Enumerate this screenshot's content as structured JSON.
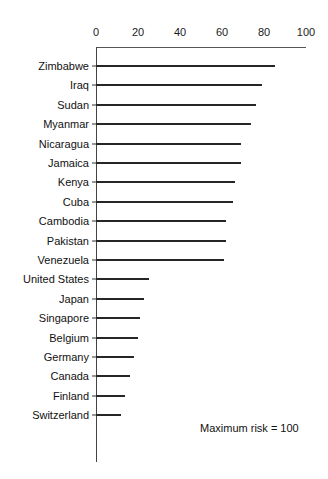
{
  "chart_data": {
    "type": "bar",
    "orientation": "horizontal",
    "title": "",
    "subtitle": "",
    "xlabel": "",
    "ylabel": "",
    "xlim": [
      0,
      100
    ],
    "xticks": [
      0,
      20,
      40,
      60,
      80,
      100
    ],
    "xtick_labels": [
      "0",
      "20",
      "40",
      "60",
      "80",
      "100"
    ],
    "grid": false,
    "legend": false,
    "legend_position": "none",
    "annotations": [
      "Maximum risk = 100"
    ],
    "categories": [
      "Zimbabwe",
      "Iraq",
      "Sudan",
      "Myanmar",
      "Nicaragua",
      "Jamaica",
      "Kenya",
      "Cuba",
      "Cambodia",
      "Pakistan",
      "Venezuela",
      "United States",
      "Japan",
      "Singapore",
      "Belgium",
      "Germany",
      "Canada",
      "Finland",
      "Switzerland"
    ],
    "values": [
      85,
      79,
      76,
      74,
      69,
      69,
      66,
      65,
      62,
      62,
      61,
      25,
      23,
      21,
      20,
      18,
      16,
      14,
      12
    ],
    "bar_color": "#262626",
    "axis_color": "#444444"
  },
  "annotation": {
    "max_risk_note": "Maximum risk = 100"
  }
}
